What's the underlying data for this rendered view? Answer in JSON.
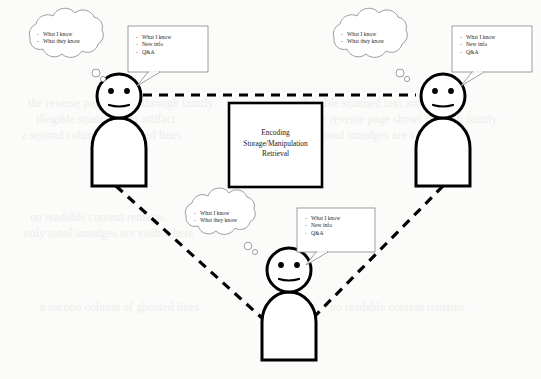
{
  "diagram": {
    "background_color": "#fbfbfa",
    "ink_color": "#000000",
    "bubble_outline_color": "#8c8c8c",
    "central_box": {
      "lines": [
        "Encoding",
        "Storage/Manipulation",
        "Retrieval"
      ],
      "border_color": "#000000"
    },
    "thought_bubble": {
      "lines": [
        "What I know",
        "What they know"
      ],
      "bullet": "-"
    },
    "speech_box": {
      "lines": [
        "What I know",
        "New info",
        "Q&A"
      ],
      "bullet": "-"
    },
    "figures": [
      {
        "id": "top-left",
        "label": "person-top-left"
      },
      {
        "id": "top-right",
        "label": "person-top-right"
      },
      {
        "id": "bottom",
        "label": "person-bottom-center"
      }
    ],
    "connectors": [
      {
        "id": "top-left-to-top-right",
        "style": "dashed"
      },
      {
        "id": "top-left-to-bottom",
        "style": "dashed"
      },
      {
        "id": "top-right-to-bottom",
        "style": "dashed"
      }
    ],
    "bleed_through_text": [
      "the reverse page shows through faintly",
      "illegible scanned text artifact",
      "a second column of ghosted lines",
      "no readable content remains",
      "only tonal smudges are visible here"
    ]
  }
}
